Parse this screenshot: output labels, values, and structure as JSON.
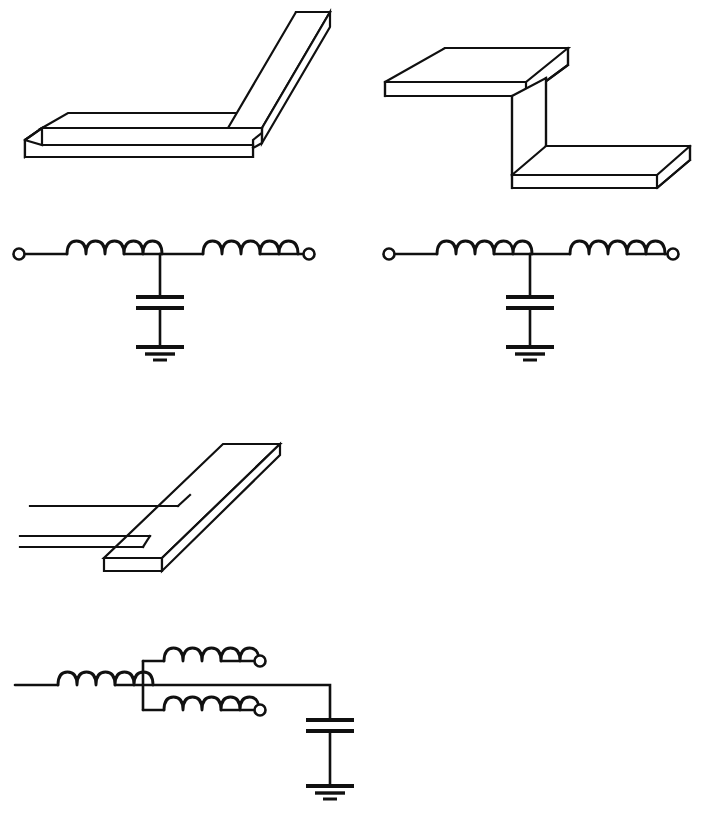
{
  "sheet": {
    "title": "Microstrip discontinuities and their equivalent circuits",
    "background_color": "#ffffff",
    "line_color": "#101010",
    "width": 711,
    "height": 818
  },
  "figures": [
    {
      "id": "microstrip-bend",
      "kind": "3d-microstrip",
      "caption": "Right-angle microstrip bend",
      "position": {
        "x": 0,
        "y": 0,
        "width": 355,
        "height": 210
      }
    },
    {
      "id": "bend-equivalent-circuit",
      "kind": "circuit",
      "caption": "Equivalent T-network for the bend",
      "topology": "T-network",
      "position": {
        "x": 0,
        "y": 225,
        "width": 355,
        "height": 150
      },
      "elements": [
        {
          "type": "terminal",
          "name": "port-1",
          "symbol": "open-circle"
        },
        {
          "type": "inductor",
          "name": "series-inductor-left",
          "coils": 5
        },
        {
          "type": "inductor",
          "name": "series-inductor-right",
          "coils": 5
        },
        {
          "type": "capacitor",
          "name": "shunt-capacitor",
          "plates": 2
        },
        {
          "type": "ground",
          "name": "ground-symbol",
          "bars": 3
        },
        {
          "type": "terminal",
          "name": "port-2",
          "symbol": "open-circle"
        }
      ]
    },
    {
      "id": "microstrip-step-offset",
      "kind": "3d-microstrip",
      "caption": "Offset / step microstrip discontinuity",
      "position": {
        "x": 360,
        "y": 20,
        "width": 351,
        "height": 190
      }
    },
    {
      "id": "step-equivalent-circuit",
      "kind": "circuit",
      "caption": "Equivalent T-network for the step",
      "topology": "T-network",
      "position": {
        "x": 370,
        "y": 225,
        "width": 341,
        "height": 150
      },
      "elements": [
        {
          "type": "terminal",
          "name": "port-1",
          "symbol": "open-circle"
        },
        {
          "type": "inductor",
          "name": "series-inductor-left",
          "coils": 5
        },
        {
          "type": "inductor",
          "name": "series-inductor-right",
          "coils": 5
        },
        {
          "type": "capacitor",
          "name": "shunt-capacitor",
          "plates": 2
        },
        {
          "type": "ground",
          "name": "ground-symbol",
          "bars": 3
        },
        {
          "type": "terminal",
          "name": "port-2",
          "symbol": "open-circle"
        }
      ]
    },
    {
      "id": "microstrip-tee-junction",
      "kind": "3d-microstrip",
      "caption": "Microstrip T-junction",
      "position": {
        "x": 0,
        "y": 425,
        "width": 320,
        "height": 160
      }
    },
    {
      "id": "tee-equivalent-circuit",
      "kind": "circuit",
      "caption": "Equivalent circuit for the T-junction",
      "topology": "three-port",
      "position": {
        "x": 0,
        "y": 630,
        "width": 400,
        "height": 188
      },
      "elements": [
        {
          "type": "inductor",
          "name": "input-series-inductor",
          "coils": 5
        },
        {
          "type": "inductor",
          "name": "branch-inductor-upper",
          "coils": 5
        },
        {
          "type": "terminal",
          "name": "port-upper",
          "symbol": "open-circle"
        },
        {
          "type": "inductor",
          "name": "branch-inductor-lower",
          "coils": 5
        },
        {
          "type": "terminal",
          "name": "port-lower",
          "symbol": "open-circle"
        },
        {
          "type": "capacitor",
          "name": "shunt-capacitor",
          "plates": 2
        },
        {
          "type": "ground",
          "name": "ground-symbol",
          "bars": 3
        }
      ]
    }
  ]
}
